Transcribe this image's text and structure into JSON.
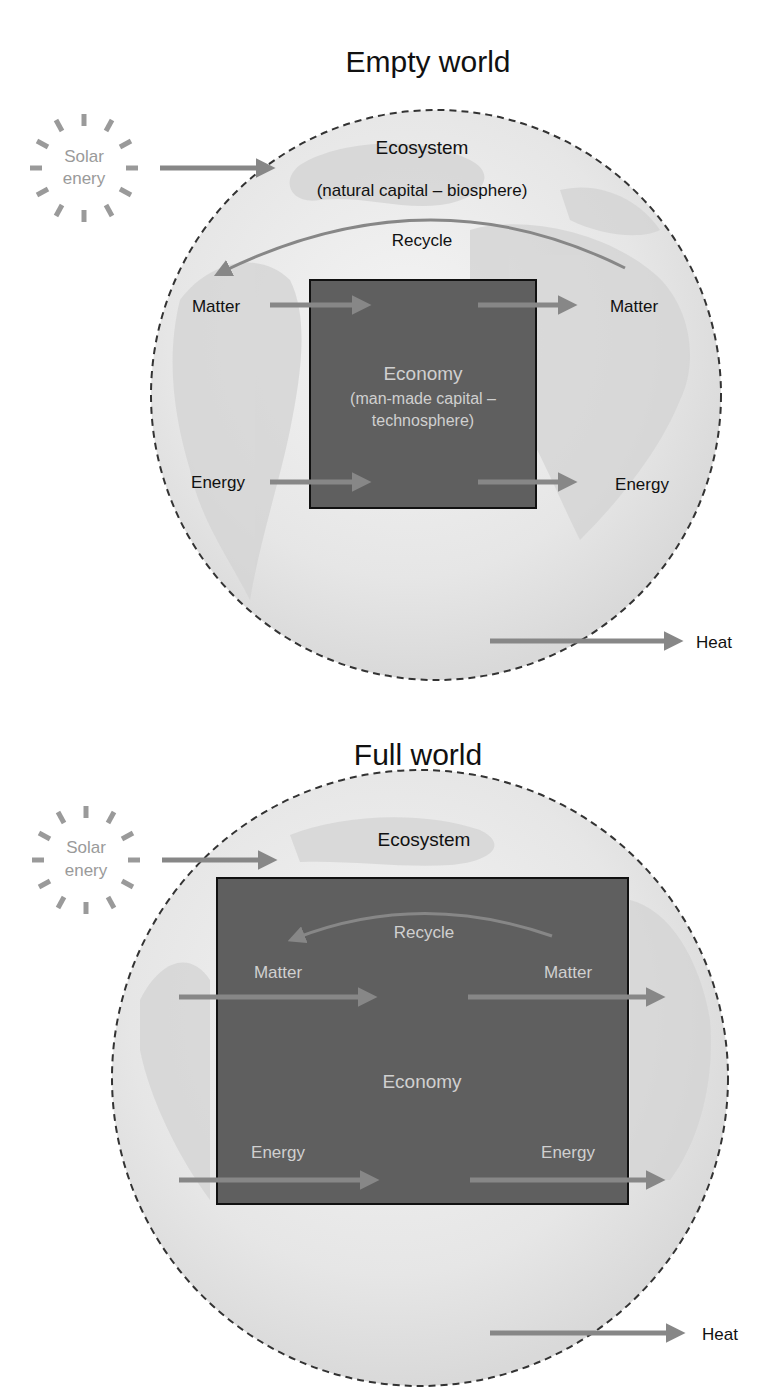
{
  "colors": {
    "globe_fill": "#e6e6e6",
    "globe_land": "#d2d2d2",
    "economy_fill": "#5f5f5f",
    "arrow": "#878787",
    "solar": "#9a9a9a",
    "text_dark": "#111111",
    "text_light": "#d8d8d8"
  },
  "empty_world": {
    "title": "Empty world",
    "solar_line1": "Solar",
    "solar_line2": "enery",
    "ecosystem_label": "Ecosystem",
    "ecosystem_sub": "(natural capital – biosphere)",
    "recycle_label": "Recycle",
    "matter_in": "Matter",
    "matter_out": "Matter",
    "energy_in": "Energy",
    "energy_out": "Energy",
    "economy_label": "Economy",
    "economy_sub1": "(man-made capital –",
    "economy_sub2": "technosphere)",
    "heat_label": "Heat"
  },
  "full_world": {
    "title": "Full world",
    "solar_line1": "Solar",
    "solar_line2": "enery",
    "ecosystem_label": "Ecosystem",
    "recycle_label": "Recycle",
    "matter_in": "Matter",
    "matter_out": "Matter",
    "energy_in": "Energy",
    "energy_out": "Energy",
    "economy_label": "Economy",
    "heat_label": "Heat"
  }
}
